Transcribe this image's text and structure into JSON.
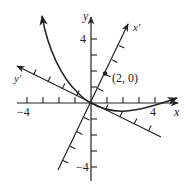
{
  "diagram": {
    "colors": {
      "ink": "#222222",
      "background": "#ffffff"
    },
    "axes": {
      "x": {
        "label": "x",
        "tick_min_label": "−4",
        "tick_max_label": "4",
        "range": [
          -4,
          5
        ]
      },
      "y": {
        "label": "y",
        "tick_max_label": "4",
        "tick_min_label": "−4",
        "range": [
          -5,
          5
        ]
      },
      "x_prime": {
        "label": "x′",
        "rotation_deg": 64
      },
      "y_prime": {
        "label": "y′",
        "rotation_deg": 154
      }
    },
    "point": {
      "label": "(2, 0)",
      "frame": "x′y′",
      "coords": [
        2,
        0
      ]
    },
    "curve": {
      "description": "curve passing through origin, rising steeply to upper left, dipping below x-axis and rising gently to the right"
    }
  }
}
